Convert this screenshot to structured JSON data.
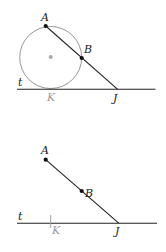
{
  "figures": [
    {
      "name": "circle-tangent-secant",
      "labels": {
        "A": "A",
        "B": "B",
        "K": "K",
        "J": "J",
        "t": "t"
      },
      "points": {
        "A": [
          45.7,
          26
        ],
        "B": [
          81.7,
          58
        ],
        "J": [
          117.7,
          89.3
        ],
        "center": [
          50.7,
          57
        ]
      },
      "circle_radius": 31,
      "line_t": {
        "y": 89.3,
        "x1": 17,
        "x2": 155.5
      }
    },
    {
      "name": "segment-without-circle",
      "labels": {
        "A": "A",
        "B": "B",
        "K": "K",
        "J": "J",
        "t": "t"
      },
      "points": {
        "A": [
          45.7,
          159.7
        ],
        "B": [
          81.7,
          191
        ],
        "J": [
          119,
          223.3
        ]
      },
      "line_t": {
        "y": 223.3,
        "x1": 17,
        "x2": 157
      },
      "k_tick_x": 50.7
    }
  ],
  "colors": {
    "line": "#222222",
    "circle": "#8a8a8a",
    "center_dot": "#aaaaaa",
    "k_label": "#9a9a9a"
  }
}
